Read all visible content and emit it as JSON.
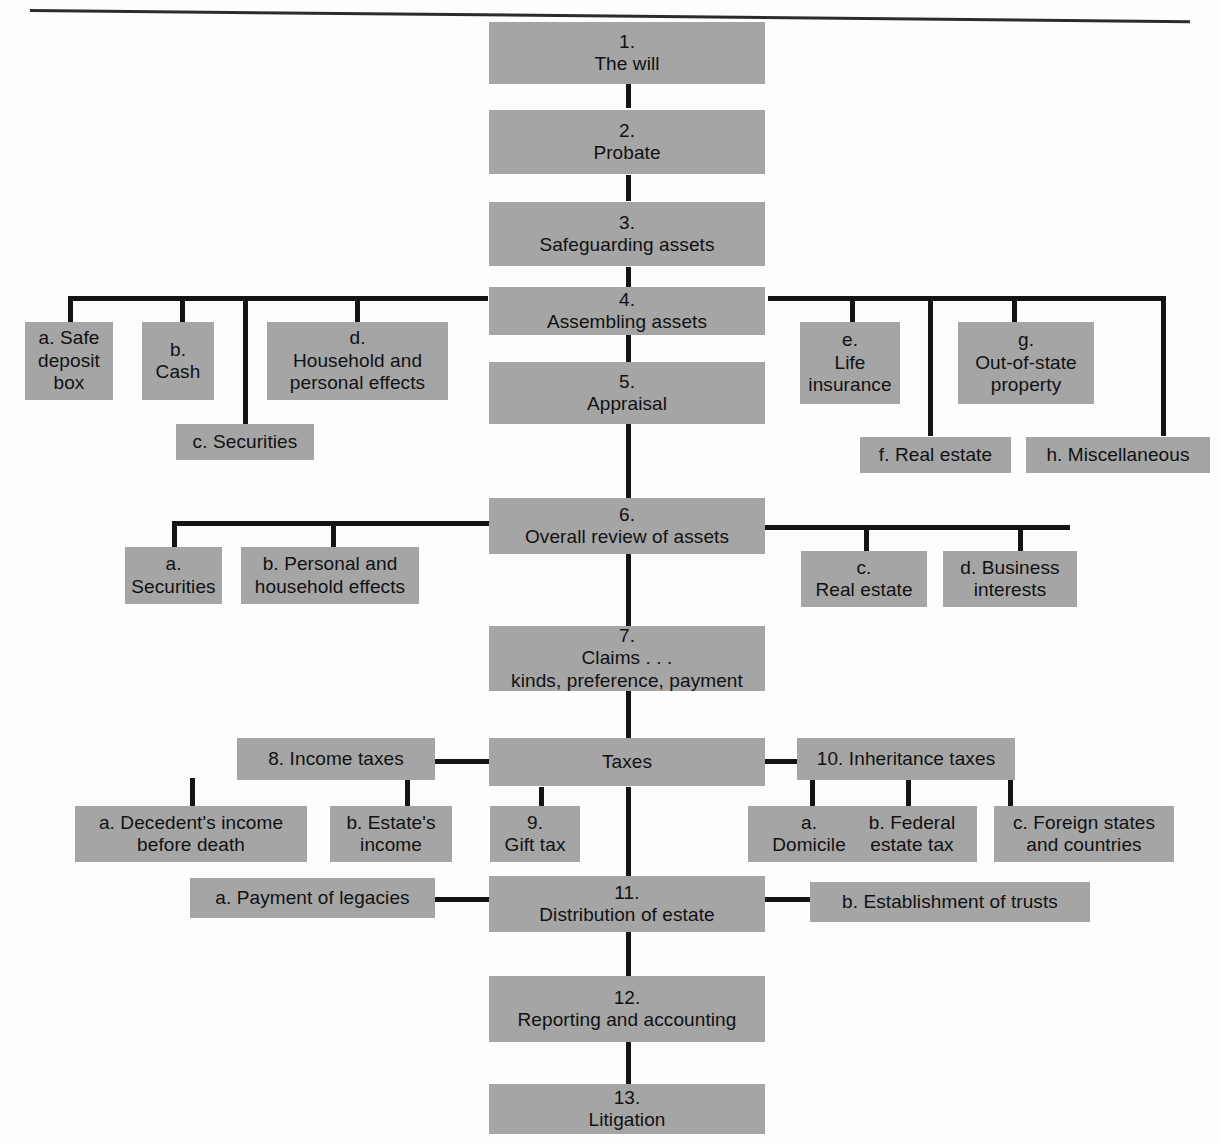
{
  "diagram": {
    "box_color": "#a5a5a5",
    "line_color": "#141414",
    "background": "#fdfdfd",
    "top_rule": true,
    "nodes": [
      {
        "id": "n1",
        "number": "1.",
        "label": "The will",
        "line1": "1.",
        "line2": "The will",
        "line3": ""
      },
      {
        "id": "n2",
        "number": "2.",
        "label": "Probate",
        "line1": "2.",
        "line2": "Probate",
        "line3": ""
      },
      {
        "id": "n3",
        "number": "3.",
        "label": "Safeguarding assets",
        "line1": "3.",
        "line2": "Safeguarding assets",
        "line3": ""
      },
      {
        "id": "n4",
        "number": "4.",
        "label": "Assembling assets",
        "line1": "4.",
        "line2": "Assembling assets",
        "line3": ""
      },
      {
        "id": "n4a",
        "number": "a.",
        "label": "a. Safe deposit box",
        "line1": "a. Safe",
        "line2": "deposit",
        "line3": "box"
      },
      {
        "id": "n4b",
        "number": "b.",
        "label": "b. Cash",
        "line1": "b.",
        "line2": "Cash",
        "line3": ""
      },
      {
        "id": "n4c",
        "number": "c.",
        "label": "c. Securities",
        "line1": "c. Securities",
        "line2": "",
        "line3": ""
      },
      {
        "id": "n4d",
        "number": "d.",
        "label": "d. Household and personal effects",
        "line1": "d.",
        "line2": "Household and",
        "line3": "personal effects"
      },
      {
        "id": "n4e",
        "number": "e.",
        "label": "e. Life insurance",
        "line1": "e.",
        "line2": "Life",
        "line3": "insurance"
      },
      {
        "id": "n4f",
        "number": "f.",
        "label": "f. Real estate",
        "line1": "f. Real estate",
        "line2": "",
        "line3": ""
      },
      {
        "id": "n4g",
        "number": "g.",
        "label": "g. Out-of-state property",
        "line1": "g.",
        "line2": "Out-of-state",
        "line3": "property"
      },
      {
        "id": "n4h",
        "number": "h.",
        "label": "h. Miscellaneous",
        "line1": "h. Miscellaneous",
        "line2": "",
        "line3": ""
      },
      {
        "id": "n5",
        "number": "5.",
        "label": "Appraisal",
        "line1": "5.",
        "line2": "Appraisal",
        "line3": ""
      },
      {
        "id": "n6",
        "number": "6.",
        "label": "Overall review of assets",
        "line1": "6.",
        "line2": "Overall review of assets",
        "line3": ""
      },
      {
        "id": "n6a",
        "number": "a.",
        "label": "a. Securities",
        "line1": "a.",
        "line2": "Securities",
        "line3": ""
      },
      {
        "id": "n6b",
        "number": "b.",
        "label": "b. Personal and household effects",
        "line1": "b. Personal and",
        "line2": "household effects",
        "line3": ""
      },
      {
        "id": "n6c",
        "number": "c.",
        "label": "c. Real estate",
        "line1": "c.",
        "line2": "Real estate",
        "line3": ""
      },
      {
        "id": "n6d",
        "number": "d.",
        "label": "d. Business interests",
        "line1": "d. Business",
        "line2": "interests",
        "line3": ""
      },
      {
        "id": "n7",
        "number": "7.",
        "label": "Claims . . . kinds, preference, payment",
        "line1": "7.",
        "line2": "Claims . . .",
        "line3": "kinds, preference, payment"
      },
      {
        "id": "ntax",
        "number": "",
        "label": "Taxes",
        "line1": "Taxes",
        "line2": "",
        "line3": ""
      },
      {
        "id": "n8",
        "number": "8.",
        "label": "8. Income taxes",
        "line1": "8. Income taxes",
        "line2": "",
        "line3": ""
      },
      {
        "id": "n8a",
        "number": "a.",
        "label": "a. Decedent's income before death",
        "line1": "a. Decedent's income",
        "line2": "before death",
        "line3": ""
      },
      {
        "id": "n8b",
        "number": "b.",
        "label": "b. Estate's income",
        "line1": "b. Estate's",
        "line2": "income",
        "line3": ""
      },
      {
        "id": "n9",
        "number": "9.",
        "label": "9. Gift tax",
        "line1": "9.",
        "line2": "Gift tax",
        "line3": ""
      },
      {
        "id": "n10",
        "number": "10.",
        "label": "10. Inheritance taxes",
        "line1": "10. Inheritance taxes",
        "line2": "",
        "line3": ""
      },
      {
        "id": "n10a",
        "number": "a.",
        "label": "a. Domicile",
        "line1": "a.",
        "line2": "Domicile",
        "line3": ""
      },
      {
        "id": "n10b",
        "number": "b.",
        "label": "b. Federal estate tax",
        "line1": "b. Federal",
        "line2": "estate tax",
        "line3": ""
      },
      {
        "id": "n10c",
        "number": "c.",
        "label": "c. Foreign states and countries",
        "line1": "c. Foreign states",
        "line2": "and countries",
        "line3": ""
      },
      {
        "id": "n11",
        "number": "11.",
        "label": "11. Distribution of estate",
        "line1": "11.",
        "line2": "Distribution of estate",
        "line3": ""
      },
      {
        "id": "n11a",
        "number": "a.",
        "label": "a. Payment of legacies",
        "line1": "a. Payment of legacies",
        "line2": "",
        "line3": ""
      },
      {
        "id": "n11b",
        "number": "b.",
        "label": "b. Establishment of trusts",
        "line1": "b. Establishment of trusts",
        "line2": "",
        "line3": ""
      },
      {
        "id": "n12",
        "number": "12.",
        "label": "12. Reporting and accounting",
        "line1": "12.",
        "line2": "Reporting and accounting",
        "line3": ""
      },
      {
        "id": "n13",
        "number": "13.",
        "label": "13. Litigation",
        "line1": "13.",
        "line2": "Litigation",
        "line3": ""
      }
    ]
  }
}
